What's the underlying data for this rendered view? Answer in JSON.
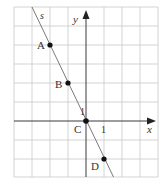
{
  "figure": {
    "type": "coordinate-grid-with-line",
    "grid": {
      "x_min": -4,
      "x_max": 4,
      "y_min": -3,
      "y_max": 6,
      "cell_w": 18,
      "cell_h": 19,
      "origin_px": [
        86,
        121
      ]
    },
    "axes": {
      "x_label": "x",
      "y_label": "y",
      "unit_x_label": "1",
      "unit_y_label": "1"
    },
    "line": {
      "label": "s",
      "equation": "y = -2x"
    },
    "points": [
      {
        "name": "A",
        "x": -2,
        "y": 4
      },
      {
        "name": "B",
        "x": -1,
        "y": 2
      },
      {
        "name": "C",
        "x": 0,
        "y": 0
      },
      {
        "name": "D",
        "x": 1,
        "y": -2
      }
    ],
    "colors": {
      "grid": "#c8c8c8",
      "axis": "#3a3a3a",
      "line": "#6a6a6a",
      "point": "#111111"
    }
  }
}
